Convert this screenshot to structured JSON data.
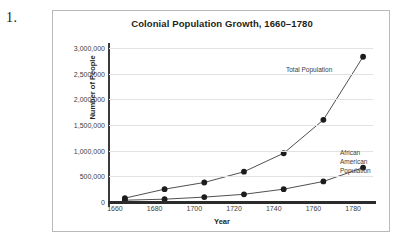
{
  "question_number": "1.",
  "chart_data": {
    "type": "line",
    "title": "Colonial Population Growth, 1660–1780",
    "xlabel": "Year",
    "ylabel": "Number of People",
    "x": [
      1665,
      1685,
      1705,
      1725,
      1745,
      1765,
      1785
    ],
    "xlim": [
      1657,
      1790
    ],
    "ylim": [
      0,
      3000000
    ],
    "xticks": [
      1660,
      1680,
      1700,
      1720,
      1740,
      1760,
      1780
    ],
    "xtick_labels": [
      "1660",
      "1680",
      "1700",
      "1720",
      "1740",
      "1760",
      "1780"
    ],
    "yticks": [
      0,
      500000,
      1000000,
      1500000,
      2000000,
      2500000,
      3000000
    ],
    "ytick_labels": [
      "0",
      "500,000",
      "1,000,000",
      "1,500,000",
      "2,000,000",
      "2,500,000",
      "3,000,000"
    ],
    "grid": true,
    "legend_position": "inline-annotations",
    "series": [
      {
        "name": "Total Population",
        "values": [
          75000,
          250000,
          380000,
          590000,
          950000,
          1600000,
          2830000
        ]
      },
      {
        "name": "African American Population",
        "values": [
          35000,
          55000,
          95000,
          150000,
          250000,
          400000,
          670000
        ]
      }
    ],
    "annotations": [
      {
        "text": "Total Population",
        "series": "Total Population"
      },
      {
        "text": "African\nAmerican\nPopulation",
        "series": "African American Population"
      }
    ]
  },
  "colors": {
    "line": "#3c3c3c",
    "point": "#1c1c1c",
    "gridline": "#e2e2e2",
    "axis": "#2b2b2b",
    "frame_border": "#b9b9b9",
    "text": "#231f20",
    "background": "#ffffff"
  }
}
